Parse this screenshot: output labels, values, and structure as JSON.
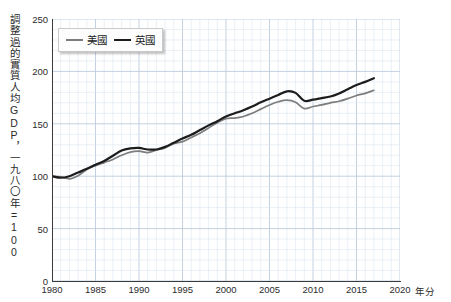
{
  "chart_data": {
    "type": "line",
    "title": "",
    "xlabel": "年分",
    "ylabel": "調整過的實質人均GDP，一九八〇年=100",
    "xlim": [
      1980,
      2020
    ],
    "ylim": [
      0,
      250
    ],
    "ytick_labels": [
      "0",
      "50",
      "100",
      "150",
      "200",
      "250"
    ],
    "ytick_values": [
      0,
      50,
      100,
      150,
      200,
      250
    ],
    "xtick_labels": [
      "1980",
      "1985",
      "1990",
      "1995",
      "2000",
      "2005",
      "2010",
      "2015",
      "2020"
    ],
    "xtick_values": [
      1980,
      1985,
      1990,
      1995,
      2000,
      2005,
      2010,
      2015,
      2020
    ],
    "grid": true,
    "grid_minor_step_x": 1,
    "grid_minor_step_y": 10,
    "legend_position": "top-left",
    "x": [
      1980,
      1981,
      1982,
      1983,
      1984,
      1985,
      1986,
      1987,
      1988,
      1989,
      1990,
      1991,
      1992,
      1993,
      1994,
      1995,
      1996,
      1997,
      1998,
      1999,
      2000,
      2001,
      2002,
      2003,
      2004,
      2005,
      2006,
      2007,
      2008,
      2009,
      2010,
      2011,
      2012,
      2013,
      2014,
      2015,
      2016,
      2017
    ],
    "series": [
      {
        "name": "美國",
        "color": "#7d7d7d",
        "width": 1.7,
        "values": [
          100,
          99.5,
          97.5,
          100.5,
          106.5,
          110,
          113,
          116,
          120,
          123,
          124,
          122.5,
          125,
          127,
          131,
          133,
          137,
          141,
          146,
          151,
          155,
          155.5,
          157,
          160,
          164,
          168,
          171,
          172.5,
          170.5,
          164.5,
          166.5,
          168,
          170,
          171.5,
          174,
          177,
          179,
          182
        ]
      },
      {
        "name": "英國",
        "color": "#1c1c1c",
        "width": 2.2,
        "values": [
          100,
          98.5,
          100,
          103.5,
          107,
          111,
          114.5,
          119.5,
          124.5,
          126.5,
          127,
          125.5,
          125.5,
          128,
          132,
          136,
          139.5,
          144,
          148.5,
          152.5,
          157,
          160,
          163,
          166.5,
          170.5,
          174,
          177.5,
          181,
          179.5,
          172,
          173,
          174.5,
          176,
          179,
          183,
          187,
          190,
          193.5
        ]
      }
    ]
  },
  "legend": {
    "items": [
      {
        "label": "美國",
        "key": "us"
      },
      {
        "label": "英國",
        "key": "uk"
      }
    ]
  },
  "colors": {
    "us_line": "#7d7d7d",
    "uk_line": "#1c1c1c",
    "grid_minor": "#dce6f0",
    "grid_major": "#bcccdd",
    "axis": "#3a3a3a",
    "text": "#2b2b2b",
    "background": "#ffffff"
  }
}
